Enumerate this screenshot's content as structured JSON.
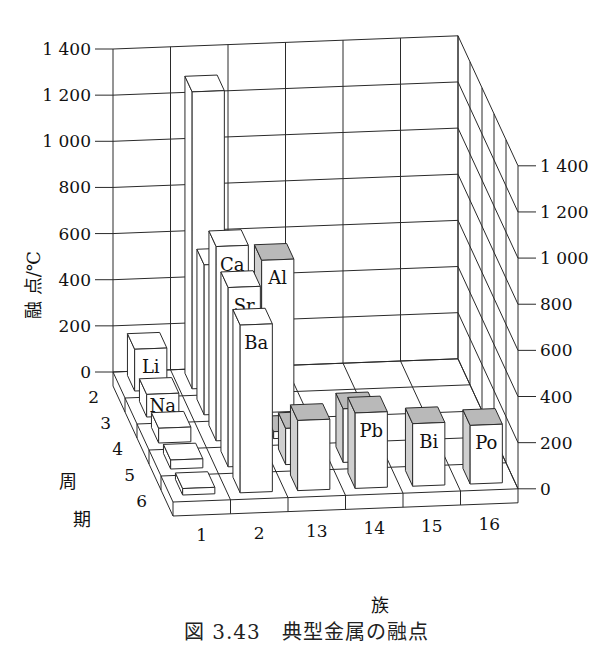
{
  "chart_data": {
    "type": "bar3d",
    "title": "",
    "caption": "図 3.43 典型金属の融点",
    "zlabel": "融 点/℃",
    "xlabel": "族",
    "ylabel": "周 期",
    "z_ticks": [
      0,
      200,
      400,
      600,
      800,
      1000,
      1200,
      1400
    ],
    "z_tick_labels": [
      "0",
      "200",
      "400",
      "600",
      "800",
      "1 000",
      "1 200",
      "1 400"
    ],
    "zlim": [
      0,
      1400
    ],
    "groups": [
      "1",
      "2",
      "13",
      "14",
      "15",
      "16"
    ],
    "periods": [
      "2",
      "3",
      "4",
      "5",
      "6"
    ],
    "bars": [
      {
        "group": "1",
        "period": "2",
        "element": "Li",
        "value": 181,
        "labeled": true,
        "shaded": false
      },
      {
        "group": "1",
        "period": "3",
        "element": "Na",
        "value": 98,
        "labeled": true,
        "shaded": false
      },
      {
        "group": "1",
        "period": "4",
        "element": "K",
        "value": 64,
        "labeled": false,
        "shaded": false
      },
      {
        "group": "1",
        "period": "5",
        "element": "Rb",
        "value": 39,
        "labeled": false,
        "shaded": false
      },
      {
        "group": "1",
        "period": "6",
        "element": "Cs",
        "value": 28,
        "labeled": false,
        "shaded": false
      },
      {
        "group": "2",
        "period": "2",
        "element": "Be",
        "value": 1287,
        "labeled": false,
        "shaded": false
      },
      {
        "group": "2",
        "period": "3",
        "element": "Mg",
        "value": 650,
        "labeled": false,
        "shaded": false
      },
      {
        "group": "2",
        "period": "4",
        "element": "Ca",
        "value": 842,
        "labeled": true,
        "shaded": false
      },
      {
        "group": "2",
        "period": "5",
        "element": "Sr",
        "value": 777,
        "labeled": true,
        "shaded": false
      },
      {
        "group": "2",
        "period": "6",
        "element": "Ba",
        "value": 727,
        "labeled": true,
        "shaded": false
      },
      {
        "group": "13",
        "period": "3",
        "element": "Al",
        "value": 660,
        "labeled": true,
        "shaded": true
      },
      {
        "group": "13",
        "period": "4",
        "element": "Ga",
        "value": 30,
        "labeled": false,
        "shaded": true
      },
      {
        "group": "13",
        "period": "5",
        "element": "In",
        "value": 157,
        "labeled": true,
        "shaded": true
      },
      {
        "group": "13",
        "period": "6",
        "element": "Tl",
        "value": 304,
        "labeled": false,
        "shaded": true
      },
      {
        "group": "14",
        "period": "5",
        "element": "Sn",
        "value": 232,
        "labeled": false,
        "shaded": true
      },
      {
        "group": "14",
        "period": "6",
        "element": "Pb",
        "value": 327,
        "labeled": true,
        "shaded": true
      },
      {
        "group": "15",
        "period": "6",
        "element": "Bi",
        "value": 271,
        "labeled": true,
        "shaded": true
      },
      {
        "group": "16",
        "period": "6",
        "element": "Po",
        "value": 254,
        "labeled": true,
        "shaded": true
      }
    ],
    "grid": true
  },
  "caption": {
    "fig_num": "図 3.43",
    "text": "典型金属の融点"
  },
  "colors": {
    "line": "#2a2a2a",
    "bar_face": "#ffffff",
    "bar_shade_top": "#b9b9b9",
    "bar_shade_side": "#cfcfcf",
    "background": "#ffffff"
  }
}
